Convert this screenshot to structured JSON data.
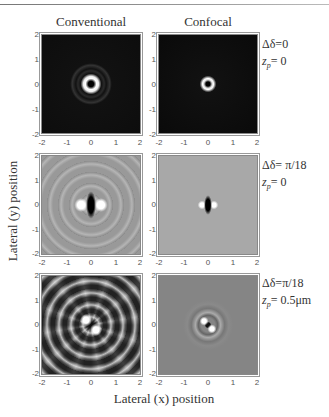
{
  "figure": {
    "column_titles": [
      "Conventional",
      "Confocal"
    ],
    "y_axis_label": "Lateral (y) position",
    "x_axis_label": "Lateral (x) position",
    "tick_labels": [
      "-2",
      "-1",
      "0",
      "1",
      "2"
    ],
    "rows": [
      {
        "delta_label": "Δδ=0",
        "zp_prefix": "z",
        "zp_sub": "p",
        "zp_value": "= 0",
        "panels": [
          {
            "column": "Conventional",
            "description": "Doughnut focal spot with dark center and faint outer rings on black background"
          },
          {
            "column": "Confocal",
            "description": "Small doughnut focal spot with dark center on black background"
          }
        ]
      },
      {
        "delta_label": "Δδ= π/18",
        "zp_prefix": "z",
        "zp_sub": "p",
        "zp_value": "= 0",
        "panels": [
          {
            "column": "Conventional",
            "description": "Dark vertical central lobe flanked by bright lobes with concentric rings on gray background"
          },
          {
            "column": "Confocal",
            "description": "Small dark vertical lobe flanked by bright lobes on gray background"
          }
        ]
      },
      {
        "delta_label": "Δδ=π/18",
        "zp_prefix": "z",
        "zp_sub": "p",
        "zp_value": "= 0.5μm",
        "panels": [
          {
            "column": "Conventional",
            "description": "Spiral interference pattern with two bright arms on gray background"
          },
          {
            "column": "Confocal",
            "description": "Compact spiral pattern on gray background"
          }
        ]
      }
    ]
  }
}
